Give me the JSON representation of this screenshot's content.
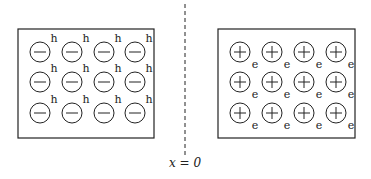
{
  "diagram": {
    "left_region": {
      "box": {
        "x": 18,
        "y": 29,
        "w": 136,
        "h": 109
      },
      "ion_sign": "−",
      "carrier_label": "h",
      "rows": 3,
      "cols": 4
    },
    "right_region": {
      "box": {
        "x": 218,
        "y": 29,
        "w": 137,
        "h": 109
      },
      "ion_sign": "+",
      "carrier_label": "e",
      "rows": 3,
      "cols": 4
    },
    "boundary": {
      "x": 185,
      "y1": 4,
      "y2": 156,
      "label": "x = 0"
    },
    "colors": {
      "line": "#222222",
      "background": "#ffffff"
    }
  }
}
